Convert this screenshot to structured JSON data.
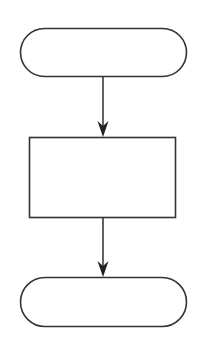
{
  "diagram": {
    "type": "flowchart",
    "stroke_color": "#333333",
    "fill_color": "#ffffff",
    "background": "#ffffff",
    "nodes": [
      {
        "id": "start",
        "shape": "terminator",
        "label": ""
      },
      {
        "id": "process",
        "shape": "process-rectangle",
        "label": ""
      },
      {
        "id": "end",
        "shape": "terminator",
        "label": ""
      }
    ],
    "edges": [
      {
        "from": "start",
        "to": "process",
        "arrow": "filled"
      },
      {
        "from": "process",
        "to": "end",
        "arrow": "filled"
      }
    ]
  }
}
